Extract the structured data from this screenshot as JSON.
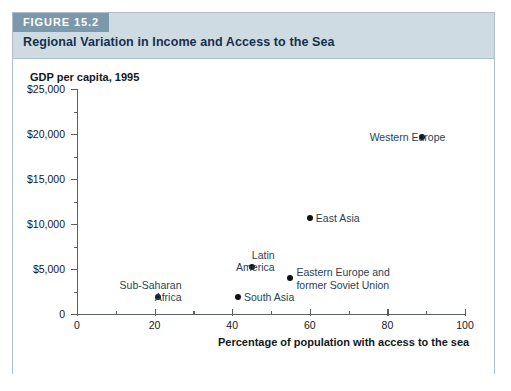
{
  "figure": {
    "tag": "FIGURE 15.2",
    "title": "Regional Variation in Income and Access to the Sea"
  },
  "colors": {
    "tag_background": "#7b99ab",
    "header_background": "#cfdbe3",
    "frame_border": "#aebfc9",
    "title_text": "#16304a",
    "point_fill": "#0d1114",
    "label_text": "#2a3f52",
    "axis": "#5a5f66"
  },
  "chart_data": {
    "type": "scatter",
    "title": "Regional Variation in Income and Access to the Sea",
    "xlabel": "Percentage of population with access to the sea",
    "ylabel": "GDP per capita, 1995",
    "xlim": [
      0,
      100
    ],
    "ylim": [
      0,
      25000
    ],
    "grid": false,
    "legend": "none",
    "xticks": [
      0,
      20,
      40,
      60,
      80,
      100
    ],
    "xticklabels": [
      "0",
      "20",
      "40",
      "60",
      "80",
      "100"
    ],
    "x_minor_interval": 10,
    "yticks": [
      0,
      5000,
      10000,
      15000,
      20000,
      25000
    ],
    "yticklabels": [
      "0",
      "$5,000",
      "$10,000",
      "$15,000",
      "$20,000",
      "$25,000"
    ],
    "y_minor_interval": 2500,
    "points": [
      {
        "label": "Sub-Saharan\nAfrica",
        "x": 21,
        "y": 1900,
        "label_position": "left"
      },
      {
        "label": "South Asia",
        "x": 41.5,
        "y": 1900,
        "label_position": "right"
      },
      {
        "label": "Latin\nAmerica",
        "x": 45,
        "y": 5200,
        "label_position": "left"
      },
      {
        "label": "Eastern Europe and\nformer Soviet Union",
        "x": 55,
        "y": 4000,
        "label_position": "right"
      },
      {
        "label": "East Asia",
        "x": 60,
        "y": 10700,
        "label_position": "right"
      },
      {
        "label": "Western Europe",
        "x": 89,
        "y": 19700,
        "label_position": "left"
      }
    ]
  }
}
